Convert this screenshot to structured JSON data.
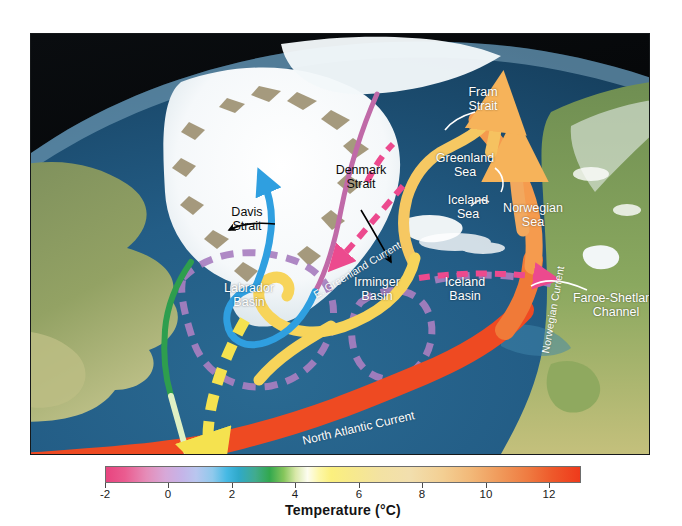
{
  "figure": {
    "kind": "oceanographic-map"
  },
  "map": {
    "place_labels": [
      {
        "id": "fram-strait",
        "text": "Fram\nStrait",
        "color": "#ffffff",
        "x": 452,
        "y": 58,
        "align": "center"
      },
      {
        "id": "greenland-sea",
        "text": "Greenland\nSea",
        "color": "#ffffff",
        "x": 434,
        "y": 124,
        "align": "center"
      },
      {
        "id": "denmark-strait",
        "text": "Denmark\nStrait",
        "color": "#0b0b0b",
        "x": 330,
        "y": 162,
        "align": "center"
      },
      {
        "id": "davis-strait",
        "text": "Davis\nStrait",
        "color": "#0b0b0b",
        "x": 214,
        "y": 190,
        "align": "center"
      },
      {
        "id": "iceland-sea",
        "text": "Iceland\nSea",
        "color": "#ffffff",
        "x": 434,
        "y": 190,
        "align": "center"
      },
      {
        "id": "norwegian-sea",
        "text": "Norwegian\nSea",
        "color": "#ffffff",
        "x": 498,
        "y": 200,
        "align": "center"
      },
      {
        "id": "labrador-basin",
        "text": "Labrador\nBasin",
        "color": "#ffffff",
        "x": 218,
        "y": 272,
        "align": "center"
      },
      {
        "id": "irminger-basin",
        "text": "Irminger\nBasin",
        "color": "#ffffff",
        "x": 345,
        "y": 263,
        "align": "center"
      },
      {
        "id": "iceland-basin",
        "text": "Iceland\nBasin",
        "color": "#ffffff",
        "x": 433,
        "y": 263,
        "align": "center"
      },
      {
        "id": "faroe-shetland-channel",
        "text": "Faroe-Shetland\nChannel",
        "color": "#ffffff",
        "x": 585,
        "y": 267,
        "align": "center"
      }
    ],
    "current_labels": [
      {
        "id": "e-greenland-current",
        "text": "E. Greenland Current",
        "color": "#ffffff",
        "x": 307,
        "y": 252,
        "rotate": -31
      },
      {
        "id": "norwegian-current",
        "text": "Norwegian Current",
        "color": "#ffffff",
        "x": 516,
        "y": 300,
        "rotate": -80
      },
      {
        "id": "north-atlantic-current",
        "text": "North Atlantic Current",
        "color": "#ffffff",
        "x": 299,
        "y": 414,
        "rotate": -13
      }
    ],
    "currents": [
      {
        "id": "north-atlantic-current-ribbon",
        "name": "North Atlantic Current",
        "style": "solid-ribbon",
        "color": "#ee4a22",
        "note": "warm inflow from the southwest"
      },
      {
        "id": "norwegian-current-ribbon",
        "name": "Norwegian Current",
        "style": "solid-ribbon",
        "color": "#f59b4e",
        "note": "warm inflow northward along Norway"
      },
      {
        "id": "fram-strait-inflow",
        "name": "Fram Strait inflow",
        "style": "solid-ribbon-arrow",
        "color": "#f6c260",
        "note": "Atlantic water entering the Arctic"
      },
      {
        "id": "irminger-current-ribbon",
        "name": "Irminger Current",
        "style": "solid-ribbon",
        "color": "#f7d45a",
        "note": "recirculation into the Irminger Basin"
      },
      {
        "id": "east-greenland-current-line",
        "name": "East Greenland Current",
        "style": "solid-line",
        "color": "#c06aa8",
        "note": "cold polar outflow along Greenland"
      },
      {
        "id": "west-greenland-current-line",
        "name": "West Greenland Current",
        "style": "solid-line",
        "color": "#2f9fe0",
        "note": "cold water around Cape Farewell"
      },
      {
        "id": "labrador-current-line",
        "name": "Labrador Current",
        "style": "solid-line",
        "color": "#2e9e4e",
        "note": "cold outflow along Labrador"
      },
      {
        "id": "overflow-dashed",
        "name": "Dense overflow pathway",
        "style": "dashed",
        "color": "#e8488f",
        "note": "pink dashed overflow across the Greenland-Scotland ridge"
      },
      {
        "id": "basin-boundary-dashed",
        "name": "Basin boundary",
        "style": "dashed",
        "color": "#a87fc0",
        "note": "violet dashed basin outlines"
      },
      {
        "id": "deep-western-boundary-dashed",
        "name": "Deep return flow",
        "style": "dashed",
        "color": "#f2e85a",
        "note": "yellow dashed southward deep return"
      }
    ]
  },
  "colorbar": {
    "title": "Temperature (°C)",
    "units": "°C",
    "min": -2,
    "max": 13,
    "ticks": [
      {
        "value": -2,
        "label": "-2"
      },
      {
        "value": 0,
        "label": "0"
      },
      {
        "value": 2,
        "label": "2"
      },
      {
        "value": 4,
        "label": "4"
      },
      {
        "value": 6,
        "label": "6"
      },
      {
        "value": 8,
        "label": "8"
      },
      {
        "value": 10,
        "label": "10"
      },
      {
        "value": 12,
        "label": "12"
      }
    ],
    "ramp": [
      "#e8447f",
      "#e58cb8",
      "#c5b4e8",
      "#8fc9ec",
      "#2fa9c9",
      "#32a84e",
      "#d8e8a8",
      "#fdfdf0",
      "#fbf07e",
      "#f3e2a3",
      "#f2b878",
      "#ef7b41",
      "#ef3a1b"
    ]
  }
}
